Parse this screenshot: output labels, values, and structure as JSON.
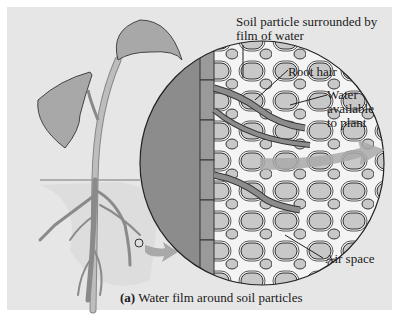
{
  "figure": {
    "caption_prefix": "(a)",
    "caption_text": " Water film around soil particles"
  },
  "labels": {
    "soil_particle_line1": "Soil particle surrounded by",
    "soil_particle_line2": "film of water",
    "root_hair": "Root hair",
    "water_line1": "Water",
    "water_line2": "available",
    "water_line3": "to plant",
    "air_space": "Air space"
  },
  "colors": {
    "panel_bg": "#e6e6e6",
    "root_cortex": "#8c8c8c",
    "soil_particle": "#c4c4c4",
    "water_film": "#ffffff",
    "arrow": "#a9a9a9",
    "outline": "#333333"
  }
}
